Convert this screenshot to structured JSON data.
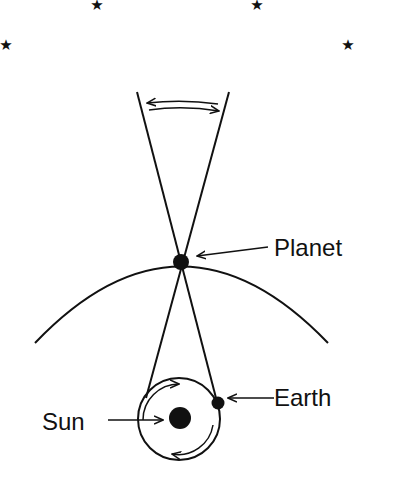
{
  "diagram": {
    "title": "",
    "labels": {
      "planet": "Planet",
      "earth": "Earth",
      "sun": "Sun"
    },
    "stars": [
      {
        "x": 97,
        "y": 4
      },
      {
        "x": 257,
        "y": 4
      },
      {
        "x": 6,
        "y": 44
      },
      {
        "x": 348,
        "y": 44
      }
    ],
    "star_glyph": "★",
    "colors": {
      "ink": "#111111",
      "background": "#ffffff"
    }
  }
}
